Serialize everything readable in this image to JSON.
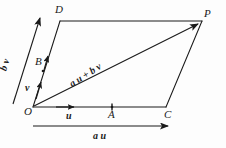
{
  "figure": {
    "kind": "vector-parallelogram-diagram",
    "background_color": "#fdfdfd",
    "stroke_color": "#1a1a1a",
    "vertices": [
      {
        "name": "O",
        "label": "O",
        "x": 33,
        "y": 107
      },
      {
        "name": "D",
        "label": "D",
        "x": 60,
        "y": 20
      },
      {
        "name": "P",
        "label": "P",
        "x": 202,
        "y": 20
      },
      {
        "name": "C",
        "label": "C",
        "x": 166,
        "y": 106
      },
      {
        "name": "A",
        "label": "A",
        "x": 112,
        "y": 106
      },
      {
        "name": "B",
        "label": "B",
        "x": 42,
        "y": 62
      }
    ],
    "labels": {
      "O": "O",
      "D": "D",
      "P": "P",
      "C": "C",
      "A": "A",
      "B": "B"
    },
    "vectors": {
      "u": {
        "scalar": "",
        "symbol": "u",
        "text": "u"
      },
      "v": {
        "scalar": "",
        "symbol": "v",
        "text": "v"
      },
      "au": {
        "scalar": "a",
        "symbol": "u",
        "text": "a u"
      },
      "bv": {
        "scalar": "b",
        "symbol": "v",
        "text": "b v"
      },
      "diagonal": {
        "scalar_1": "a",
        "symbol_1": "u",
        "plus": "+",
        "scalar_2": "b",
        "symbol_2": "v",
        "text": "a u + b v"
      }
    }
  }
}
